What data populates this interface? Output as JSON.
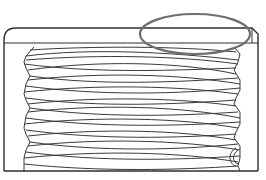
{
  "figure": {
    "description": "Threaded part section drawing with highlighted top-right region",
    "colors": {
      "background": "#ffffff",
      "line": "#2e2e2e",
      "thread": "#3a3a3a",
      "highlight": "#6e6e6e"
    },
    "outline": {
      "left": 4,
      "top": 28,
      "right": 258,
      "bottom": 171,
      "corner_radius": 12,
      "inner_line_y": 43
    },
    "thread": {
      "left_x": 24,
      "right_x": 240,
      "top_y": 47,
      "bottom_y": 171,
      "crests_left": [
        62,
        104,
        140
      ],
      "turns": 8
    },
    "highlight_ellipse": {
      "cx": 195,
      "cy": 34,
      "rx": 55,
      "ry": 20
    }
  }
}
